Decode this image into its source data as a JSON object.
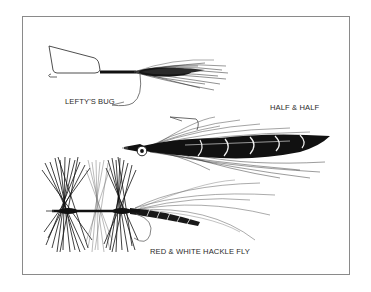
{
  "illustration": {
    "subject": "fishing flies",
    "frame_color": "#8a8a8a",
    "ink_color": "#111111",
    "flies": [
      {
        "name": "lefty-s-bug",
        "label": "LEFTY'S BUG"
      },
      {
        "name": "half-and-half",
        "label": "HALF & HALF"
      },
      {
        "name": "red-and-white-hackle-fly",
        "label": "RED & WHITE HACKLE FLY"
      }
    ]
  }
}
